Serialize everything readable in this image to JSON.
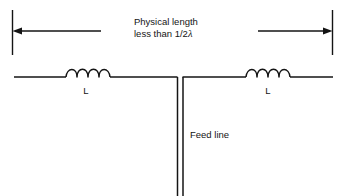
{
  "diagram": {
    "type": "loaded-dipole-antenna-schematic",
    "background_color": "#ffffff",
    "line_color": "#141414",
    "text_color": "#141414",
    "dimension": {
      "label_line1": "Physical length",
      "label_line2_prefix": "less than 1/",
      "label_line2_denominator": "2",
      "label_line2_symbol": "λ",
      "label_full": "Physical length less than 1/2λ",
      "arrow_style": "double-ended-with-extension-ticks"
    },
    "components": {
      "inductor_left_label": "L",
      "inductor_right_label": "L",
      "inductor_loop_count": 4
    },
    "feed": {
      "label": "Feed line",
      "conductor_count": 2
    }
  }
}
